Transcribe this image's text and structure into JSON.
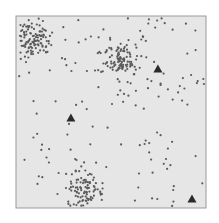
{
  "chart_data": {
    "type": "scatter",
    "title": "",
    "xlabel": "",
    "ylabel": "",
    "xlim": [
      0,
      1
    ],
    "ylim": [
      0,
      1
    ],
    "grid": false,
    "legend": null,
    "frame": {
      "left": 16,
      "top": 16,
      "right": 206,
      "bottom": 208,
      "background": "#e6e6e6",
      "border": "#9a9a9a"
    },
    "colors": {
      "point": "#5a5a5a",
      "triangle": "#2a2a2a"
    },
    "series": [
      {
        "name": "cluster-points",
        "marker": "circle",
        "clusters": [
          {
            "center": [
              0.084,
              0.115
            ],
            "spread": 0.05,
            "count": 120
          },
          {
            "center": [
              0.547,
              0.229
            ],
            "spread": 0.05,
            "count": 110
          },
          {
            "center": [
              0.363,
              0.915
            ],
            "spread": 0.05,
            "count": 100
          }
        ]
      },
      {
        "name": "background-points",
        "marker": "circle",
        "uniform_count": 150
      },
      {
        "name": "centroids",
        "marker": "triangle",
        "points": [
          [
            0.747,
            0.276
          ],
          [
            0.289,
            0.531
          ],
          [
            0.926,
            0.953
          ]
        ]
      }
    ]
  }
}
